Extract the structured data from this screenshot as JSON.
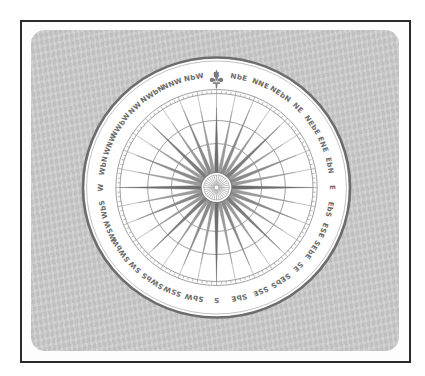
{
  "figure": {
    "north_emblem": "fleur-de-lis-icon",
    "colors": {
      "panel": "#cdcdcd",
      "frame": "#2a2a2a",
      "dial": "#ffffff",
      "lines": "#7a7a7a",
      "labels": "#6a6a6a"
    },
    "points": [
      "N",
      "NbE",
      "NNE",
      "NEbN",
      "NE",
      "NEbE",
      "ENE",
      "EbN",
      "E",
      "EbS",
      "ESE",
      "SEbE",
      "SE",
      "SEbS",
      "SSE",
      "SbE",
      "S",
      "SbW",
      "SSW",
      "SWbS",
      "SW",
      "SWbW",
      "WSW",
      "WbS",
      "W",
      "WbN",
      "WNW",
      "NWbW",
      "NW",
      "NWbN",
      "NNW",
      "NbW"
    ]
  }
}
